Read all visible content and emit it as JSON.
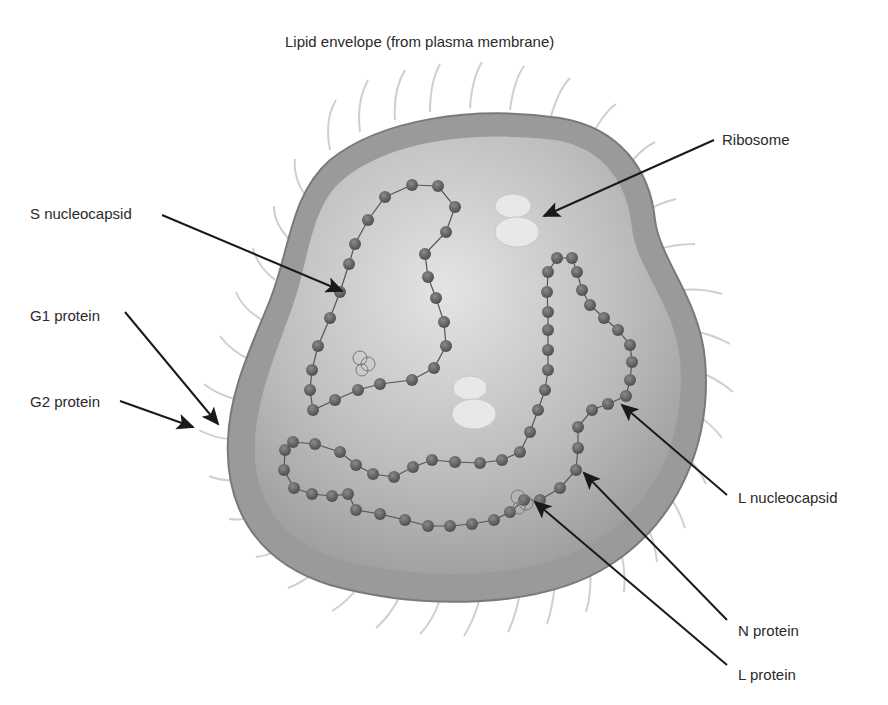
{
  "diagram": {
    "title": "Lipid envelope (from plasma membrane)",
    "labels": {
      "s_nucleocapsid": "S nucleocapsid",
      "g1_protein": "G1 protein",
      "g2_protein": "G2 protein",
      "ribosome": "Ribosome",
      "l_nucleocapsid": "L nucleocapsid",
      "n_protein": "N protein",
      "l_protein": "L protein"
    },
    "colors": {
      "membrane": "#8c8c8c",
      "interior": "#bdbdbd",
      "bead": "#5a5a5a",
      "ribosome": "#e6e6e6",
      "arrow": "#1a1a1a",
      "spike": "#d0d0d0"
    }
  }
}
